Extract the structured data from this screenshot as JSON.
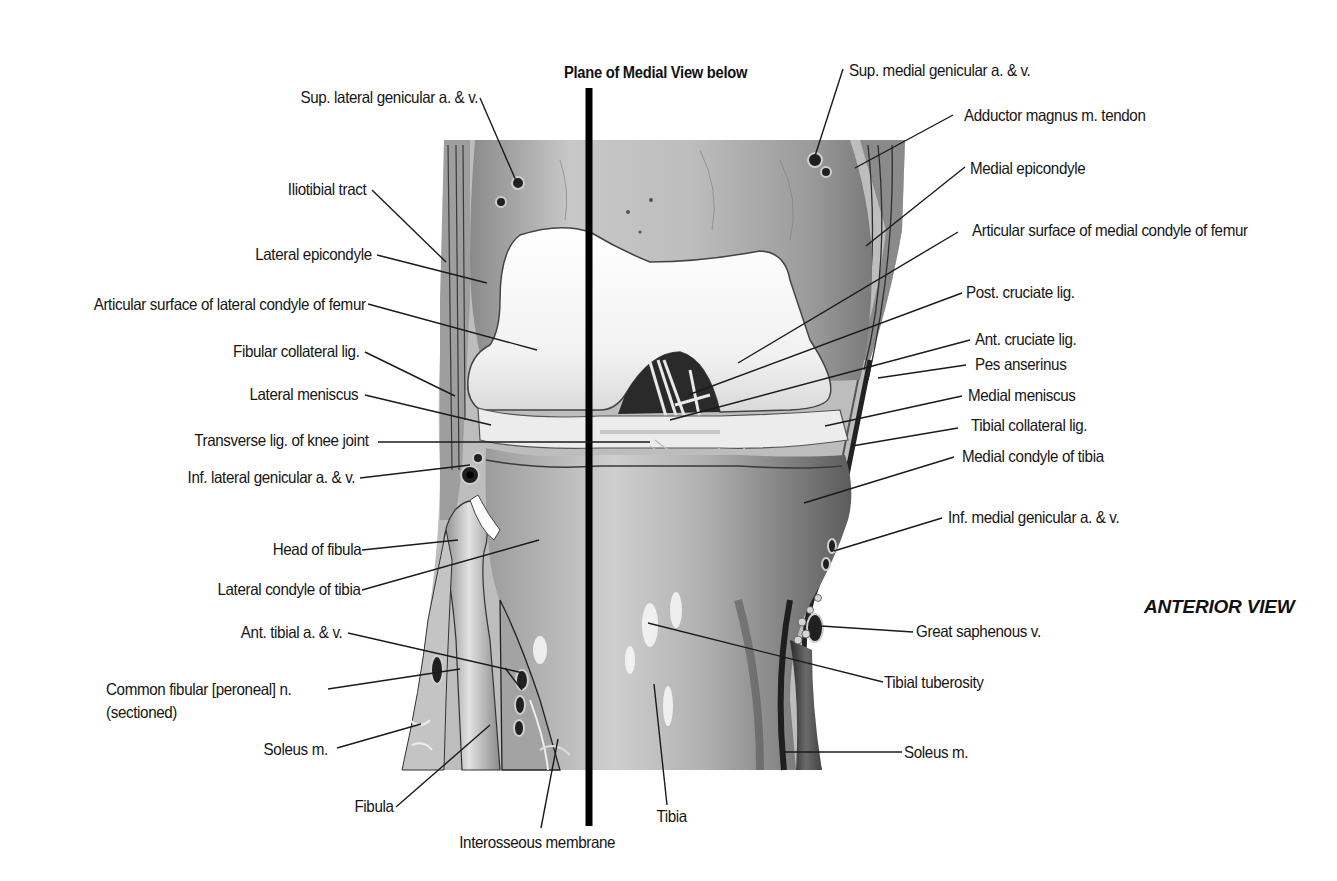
{
  "figure": {
    "title": "Plane of Medial View below",
    "view_label": "ANTERIOR VIEW"
  },
  "labels_left": [
    {
      "id": "sup-lat-genicular",
      "text": "Sup. lateral genicular a. & v.",
      "x": 478,
      "y": 98,
      "line": [
        [
          480,
          98
        ],
        [
          517,
          183
        ]
      ]
    },
    {
      "id": "iliotibial-tract",
      "text": "Iliotibial tract",
      "x": 366,
      "y": 190,
      "line": [
        [
          372,
          190
        ],
        [
          446,
          262
        ]
      ]
    },
    {
      "id": "lat-epicondyle",
      "text": "Lateral epicondyle",
      "x": 372,
      "y": 255,
      "line": [
        [
          377,
          255
        ],
        [
          487,
          283
        ]
      ]
    },
    {
      "id": "art-surf-lat-condyle",
      "text": "Articular surface of lateral condyle of femur",
      "x": 366,
      "y": 305,
      "line": [
        [
          368,
          304
        ],
        [
          537,
          350
        ]
      ]
    },
    {
      "id": "fibular-collateral",
      "text": "Fibular collateral lig.",
      "x": 360,
      "y": 352,
      "line": [
        [
          365,
          352
        ],
        [
          455,
          396
        ]
      ]
    },
    {
      "id": "lat-meniscus",
      "text": "Lateral meniscus",
      "x": 358,
      "y": 395,
      "line": [
        [
          365,
          395
        ],
        [
          491,
          425
        ]
      ]
    },
    {
      "id": "transverse-lig",
      "text": "Transverse lig. of knee joint",
      "x": 369,
      "y": 441,
      "line": [
        [
          378,
          442
        ],
        [
          650,
          442
        ]
      ]
    },
    {
      "id": "inf-lat-genicular",
      "text": "Inf. lateral genicular a. & v.",
      "x": 355,
      "y": 478,
      "line": [
        [
          360,
          478
        ],
        [
          470,
          465
        ]
      ]
    },
    {
      "id": "head-of-fibula",
      "text": "Head of fibula",
      "x": 361,
      "y": 550,
      "line": [
        [
          362,
          550
        ],
        [
          458,
          540
        ]
      ]
    },
    {
      "id": "lat-condyle-tibia",
      "text": "Lateral condyle of tibia",
      "x": 361,
      "y": 590,
      "line": [
        [
          362,
          590
        ],
        [
          539,
          540
        ]
      ]
    },
    {
      "id": "ant-tibial",
      "text": "Ant. tibial a. & v.",
      "x": 342,
      "y": 633,
      "line": [
        [
          348,
          633
        ],
        [
          523,
          673
        ]
      ],
      "line2": [
        [
          505,
          668
        ],
        [
          522,
          690
        ]
      ]
    },
    {
      "id": "common-fibular",
      "text": "Common fibular [peroneal] n.",
      "text2": "(sectioned)",
      "x": 106,
      "y": 690,
      "x2": 106,
      "y2": 713,
      "anchor": "left",
      "line": [
        [
          328,
          689
        ],
        [
          460,
          669
        ]
      ]
    },
    {
      "id": "soleus-left",
      "text": "Soleus m.",
      "x": 328,
      "y": 750,
      "line": [
        [
          337,
          748
        ],
        [
          421,
          724
        ]
      ]
    },
    {
      "id": "fibula",
      "text": "Fibula",
      "x": 394,
      "y": 807,
      "line": [
        [
          396,
          807
        ],
        [
          490,
          725
        ]
      ]
    },
    {
      "id": "interosseous",
      "text": "Interosseous membrane",
      "x": 544,
      "y": 843,
      "anchor": "center",
      "line": [
        [
          541,
          828
        ],
        [
          558,
          739
        ]
      ]
    }
  ],
  "labels_right": [
    {
      "id": "sup-med-genicular",
      "text": "Sup. medial genicular a. & v.",
      "x": 849,
      "y": 71,
      "line": [
        [
          843,
          69
        ],
        [
          815,
          156
        ]
      ]
    },
    {
      "id": "adductor-magnus",
      "text": "Adductor magnus m. tendon",
      "x": 964,
      "y": 116,
      "line": [
        [
          953,
          115
        ],
        [
          855,
          168
        ]
      ]
    },
    {
      "id": "med-epicondyle",
      "text": "Medial epicondyle",
      "x": 970,
      "y": 169,
      "line": [
        [
          965,
          167
        ],
        [
          866,
          246
        ]
      ]
    },
    {
      "id": "art-surf-med-condyle",
      "text": "Articular surface of medial condyle of femur",
      "x": 972,
      "y": 231,
      "line": [
        [
          958,
          232
        ],
        [
          738,
          363
        ]
      ]
    },
    {
      "id": "post-cruciate",
      "text": "Post. cruciate lig.",
      "x": 966,
      "y": 293,
      "line": [
        [
          962,
          293
        ],
        [
          688,
          395
        ]
      ]
    },
    {
      "id": "ant-cruciate",
      "text": "Ant. cruciate lig.",
      "x": 975,
      "y": 340,
      "line": [
        [
          970,
          340
        ],
        [
          670,
          420
        ]
      ]
    },
    {
      "id": "pes-anserinus",
      "text": "Pes anserinus",
      "x": 975,
      "y": 365,
      "line": [
        [
          966,
          365
        ],
        [
          878,
          378
        ]
      ]
    },
    {
      "id": "med-meniscus",
      "text": "Medial meniscus",
      "x": 968,
      "y": 396,
      "line": [
        [
          962,
          396
        ],
        [
          825,
          426
        ]
      ]
    },
    {
      "id": "tibial-collateral",
      "text": "Tibial collateral lig.",
      "x": 971,
      "y": 426,
      "line": [
        [
          958,
          428
        ],
        [
          852,
          446
        ]
      ]
    },
    {
      "id": "med-condyle-tibia",
      "text": "Medial condyle of tibia",
      "x": 962,
      "y": 457,
      "line": [
        [
          954,
          457
        ],
        [
          804,
          503
        ]
      ]
    },
    {
      "id": "inf-med-genicular",
      "text": "Inf. medial genicular a. & v.",
      "x": 948,
      "y": 518,
      "line": [
        [
          942,
          518
        ],
        [
          834,
          551
        ]
      ]
    },
    {
      "id": "great-saphenous",
      "text": "Great saphenous v.",
      "x": 916,
      "y": 632,
      "line": [
        [
          821,
          626
        ],
        [
          913,
          632
        ]
      ]
    },
    {
      "id": "tibial-tuberosity",
      "text": "Tibial tuberosity",
      "x": 884,
      "y": 683,
      "line": [
        [
          648,
          623
        ],
        [
          883,
          682
        ]
      ]
    },
    {
      "id": "soleus-right",
      "text": "Soleus m.",
      "x": 904,
      "y": 753,
      "line": [
        [
          784,
          752
        ],
        [
          902,
          752
        ]
      ]
    },
    {
      "id": "tibia",
      "text": "Tibia",
      "x": 673,
      "y": 817,
      "anchor": "center",
      "line": [
        [
          654,
          684
        ],
        [
          667,
          805
        ]
      ]
    }
  ],
  "plane_line": {
    "x": 589,
    "y1": 88,
    "y2": 826,
    "width": 7,
    "color": "#000000"
  },
  "colors": {
    "background": "#ffffff",
    "text": "#151515",
    "leader": "#1a1a1a",
    "cartilage": "#f4f4f4",
    "bone_mid": "#b9b9b9",
    "bone_dark": "#6e6e6e",
    "shadow": "#3a3a3a"
  }
}
